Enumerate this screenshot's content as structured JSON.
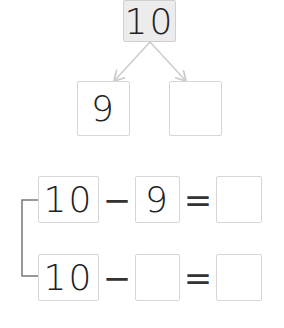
{
  "number_bond": {
    "whole": "10",
    "part_left": "9",
    "part_right": ""
  },
  "equations": [
    {
      "a": "10",
      "op": "−",
      "b": "9",
      "eq": "=",
      "result": ""
    },
    {
      "a": "10",
      "op": "−",
      "b": "",
      "eq": "=",
      "result": ""
    }
  ],
  "colors": {
    "box_border": "#d6d6d6",
    "whole_fill": "#ececec",
    "arrow": "#cccccc",
    "bracket": "#777777"
  }
}
